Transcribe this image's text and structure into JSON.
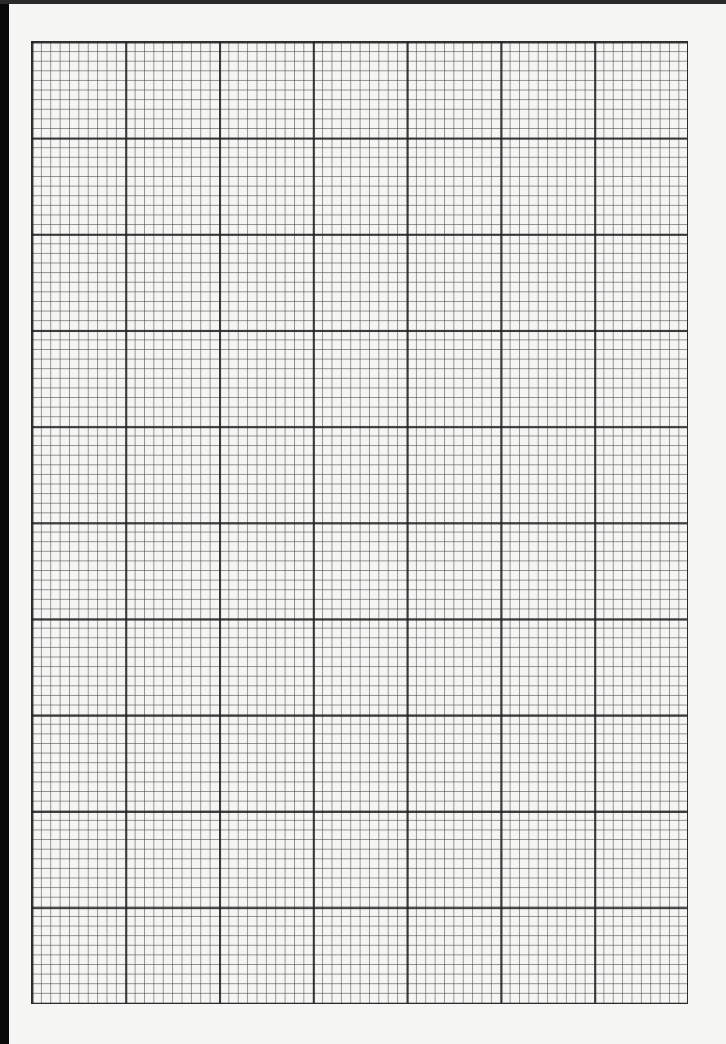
{
  "sheet": {
    "type": "graph paper",
    "major_columns": 7,
    "major_rows": 10,
    "minor_per_major": 10,
    "line_color": "#2b2b2b",
    "paper_color": "#f5f5f4",
    "edge_color": "#0a0a0a"
  }
}
